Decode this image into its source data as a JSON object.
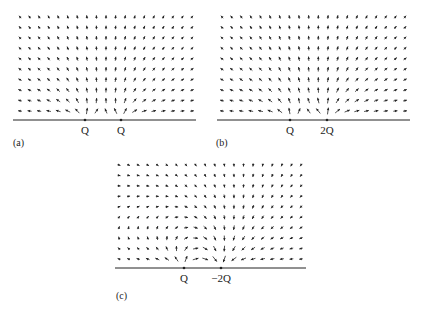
{
  "panels": [
    {
      "id": "a",
      "label": "(a)",
      "label_pos": [
        13,
        138
      ],
      "axis": {
        "y": 120,
        "x0": 13,
        "x1": 196
      },
      "grid": {
        "x0": 20,
        "x1": 192,
        "cols": 19,
        "y0": 17,
        "y1": 111,
        "rows": 10
      },
      "charges": [
        {
          "name": "Q",
          "q": 1,
          "x": 85
        },
        {
          "name": "Q",
          "q": 1,
          "x": 121
        }
      ]
    },
    {
      "id": "b",
      "label": "(b)",
      "label_pos": [
        216,
        138
      ],
      "axis": {
        "y": 120,
        "x0": 217,
        "x1": 410
      },
      "grid": {
        "x0": 222,
        "x1": 405,
        "cols": 20,
        "y0": 17,
        "y1": 111,
        "rows": 10
      },
      "charges": [
        {
          "name": "Q",
          "q": 1,
          "x": 290
        },
        {
          "name": "2Q",
          "q": 2,
          "x": 327
        }
      ]
    },
    {
      "id": "c",
      "label": "(c)",
      "label_pos": [
        116,
        291
      ],
      "axis": {
        "y": 268,
        "x0": 115,
        "x1": 306
      },
      "grid": {
        "x0": 119,
        "x1": 301,
        "cols": 20,
        "y0": 165,
        "y1": 259,
        "rows": 10
      },
      "charges": [
        {
          "name": "Q",
          "q": 1,
          "x": 184
        },
        {
          "name": "−2Q",
          "q": -2,
          "x": 221
        }
      ]
    }
  ],
  "colors": {
    "ink": "#222222",
    "background": "#ffffff"
  }
}
